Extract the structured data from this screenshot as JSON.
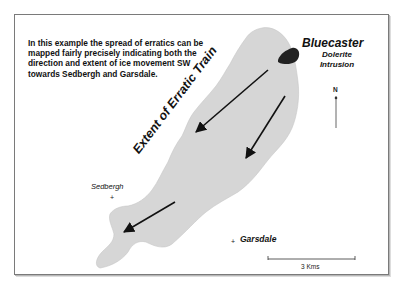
{
  "description": "In this example the spread of erratics can be mapped fairly precisely indicating both the direction and extent of ice movement SW towards Sedbergh and Garsdale.",
  "description_lines": [
    "In this example the spread of erratics can be",
    "mapped fairly precisely indicating both the",
    "direction and extent of ice movement SW",
    "towards Sedbergh and Garsdale."
  ],
  "source": {
    "name": "Bluecaster",
    "type_line1": "Dolerite",
    "type_line2": "Intrusion"
  },
  "region_label": "Extent of Erratic Train",
  "places": [
    {
      "name": "Sedbergh"
    },
    {
      "name": "Garsdale"
    }
  ],
  "north_arrow": {
    "label": "N"
  },
  "scale_bar": {
    "label": "3 Kms"
  },
  "colors": {
    "region_fill": "#d6d6d6",
    "intrusion_fill": "#222222",
    "arrow": "#111111",
    "frame_border": "#7a7a7a"
  }
}
